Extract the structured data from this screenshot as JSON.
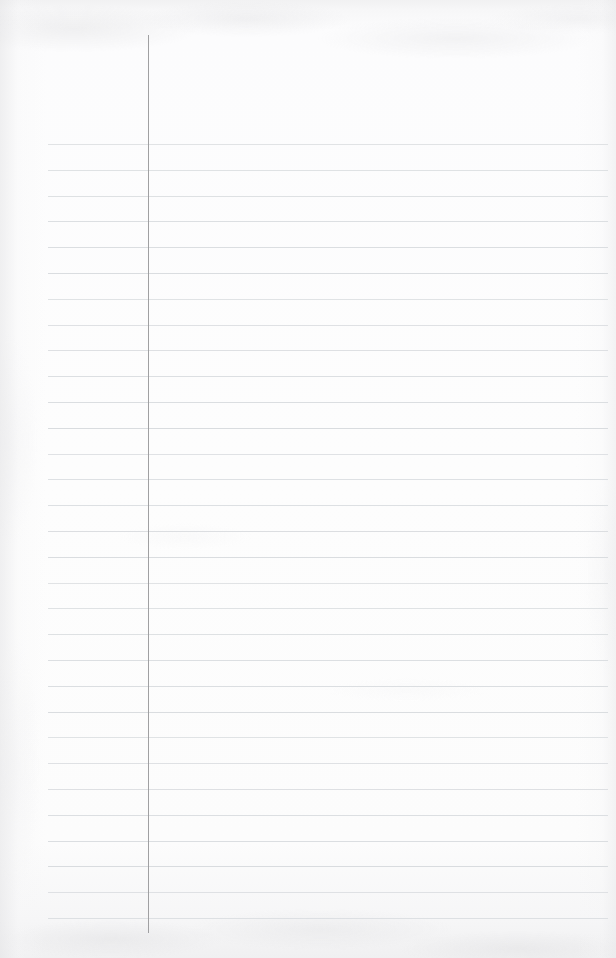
{
  "document": {
    "kind": "ruled-notebook-paper",
    "title": "Blank Ruled Notebook Page",
    "content_text": "",
    "has_handwriting": false,
    "has_printed_text": false,
    "page_width": 616,
    "page_height": 958
  },
  "paper": {
    "background_color": "#fdfdfd",
    "edge_tint_color": "#f0f0f1",
    "texture": "light scanner grain with mottled top and bottom edges"
  },
  "ruling": {
    "line_color": "#d9dcdf",
    "line_thickness": 1,
    "line_count": 31,
    "first_line_y": 144,
    "line_spacing": 25.8,
    "line_start_x": 48,
    "line_end_x": 608
  },
  "margin_rule": {
    "label": "vertical margin line",
    "color": "#9b9b9d",
    "thickness": 1,
    "x": 148,
    "top_y": 35,
    "bottom_y": 933
  }
}
